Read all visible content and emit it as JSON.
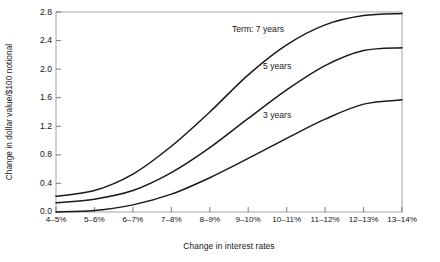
{
  "chart_data": {
    "type": "line",
    "title": "",
    "xlabel": "Change in interest rates",
    "ylabel": "Change in dollar value/$100 notional",
    "categories": [
      "4–5%",
      "5–6%",
      "6–7%",
      "7–8%",
      "8–9%",
      "9–10%",
      "10–11%",
      "11–12%",
      "12–13%",
      "13–14%"
    ],
    "ylim": [
      0.0,
      2.8
    ],
    "yticks": [
      "0.0",
      "0.4",
      "0.8",
      "1.2",
      "1.6",
      "2.0",
      "2.4",
      "2.8"
    ],
    "ytick_values": [
      0.0,
      0.4,
      0.8,
      1.2,
      1.6,
      2.0,
      2.4,
      2.8
    ],
    "grid": false,
    "legend_position": "inline-annotations",
    "series": [
      {
        "name": "Term: 7 years",
        "label": "Term: 7 years",
        "values": [
          0.22,
          0.3,
          0.53,
          0.92,
          1.4,
          1.92,
          2.34,
          2.62,
          2.75,
          2.78
        ]
      },
      {
        "name": "5 years",
        "label": "5 years",
        "values": [
          0.13,
          0.18,
          0.3,
          0.55,
          0.9,
          1.31,
          1.71,
          2.05,
          2.26,
          2.3
        ]
      },
      {
        "name": "3 years",
        "label": "3 years",
        "values": [
          0.0,
          0.02,
          0.1,
          0.25,
          0.48,
          0.75,
          1.03,
          1.3,
          1.51,
          1.57
        ]
      }
    ],
    "annotations": [
      {
        "text": "Term: 7 years",
        "series": "Term: 7 years"
      },
      {
        "text": "5 years",
        "series": "5 years"
      },
      {
        "text": "3 years",
        "series": "3 years"
      }
    ],
    "colors": {
      "line": "#1a1a1a",
      "axis": "#8a8a8a",
      "background": "#ffffff"
    }
  }
}
